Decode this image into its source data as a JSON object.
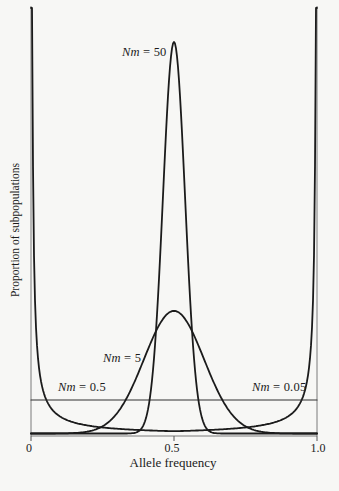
{
  "figure": {
    "background": "#f7f7f5",
    "axis_color": "#7a7a7a",
    "curve_color": "#1b1b1b",
    "xlabel": "Allele frequency",
    "ylabel": "Proportion of subpopulations",
    "x_tick_labels": [
      "0",
      "0.5",
      "1.0"
    ]
  },
  "chart_data": {
    "type": "line",
    "xlabel": "Allele frequency",
    "ylabel": "Proportion of subpopulations",
    "x_range": [
      0,
      1
    ],
    "x_ticks": [
      0,
      0.5,
      1.0
    ],
    "y_axis_scale": "relative proportion, unlabeled axis (peak of Nm=50 curve = 1.0)",
    "grid": false,
    "legend": "inline curve labels",
    "series": [
      {
        "nm": 50,
        "label_var": "Nm",
        "label_rest": " = 50",
        "shape": "gaussian",
        "center": 0.5,
        "sigma": 0.0385,
        "peak": 1.0,
        "description": "very narrow spike centered at allele frequency 0.5"
      },
      {
        "nm": 5,
        "label_var": "Nm",
        "label_rest": " = 5",
        "shape": "gaussian",
        "center": 0.5,
        "sigma": 0.105,
        "peak": 0.313,
        "description": "broad bell centered at 0.5"
      },
      {
        "nm": 0.5,
        "label_var": "Nm",
        "label_rest": " = 0.5",
        "shape": "uniform",
        "level": 0.0856,
        "description": "flat uniform distribution across all allele frequencies"
      },
      {
        "nm": 0.05,
        "label_var": "Nm",
        "label_rest": " = 0.05",
        "shape": "u_shaped",
        "k": 0.0048,
        "base": 0.0038,
        "max": 1.087,
        "description": "strongly U-shaped: mass piled near fixation at 0 and 1, near zero in middle"
      }
    ]
  }
}
